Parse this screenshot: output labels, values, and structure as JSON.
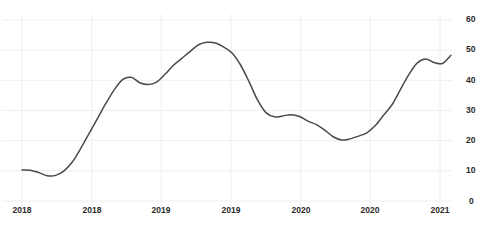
{
  "chart_data": {
    "type": "line",
    "title": "",
    "xlabel": "",
    "ylabel": "",
    "ylim": [
      0,
      60
    ],
    "yticks": [
      0,
      10,
      20,
      30,
      40,
      50,
      60
    ],
    "ytick_labels": [
      "0",
      "10",
      "20",
      "30",
      "40",
      "50",
      "60"
    ],
    "xtick_labels": [
      "2018",
      "2018",
      "2019",
      "2019",
      "2020",
      "2020",
      "2021"
    ],
    "grid": true,
    "legend": null,
    "series": [
      {
        "name": "series-1",
        "color": "#4a4a4a",
        "x": [
          0,
          1,
          2,
          3,
          4,
          5,
          6,
          7,
          8,
          9,
          10,
          11,
          12,
          13,
          14,
          15,
          16,
          17,
          18,
          19,
          20,
          21,
          22,
          23,
          24,
          25,
          26,
          27,
          28,
          29,
          30,
          31,
          32,
          33,
          34,
          35,
          36,
          37,
          38
        ],
        "values": [
          10.3,
          10.2,
          9.4,
          8.4,
          8.5,
          10.0,
          13.0,
          17.5,
          22.5,
          27.5,
          32.5,
          37.0,
          40.3,
          41.0,
          39.2,
          38.6,
          39.4,
          42.0,
          45.0,
          47.3,
          49.6,
          51.8,
          52.6,
          52.4,
          51.0,
          49.0,
          45.0,
          39.5,
          33.5,
          29.3,
          27.9,
          28.2,
          28.6,
          28.0,
          26.5,
          25.3,
          23.5,
          21.3,
          20.2
        ]
      }
    ],
    "series_tail": {
      "x": [
        38,
        39,
        40,
        41,
        42,
        43,
        44,
        45,
        46,
        47,
        48
      ],
      "values": [
        20.2,
        20.6,
        21.5,
        22.6,
        25.0,
        28.5,
        32.0,
        37.0,
        42.0,
        45.8,
        47.1
      ]
    },
    "series_end": {
      "x": [
        48,
        49,
        50,
        51
      ],
      "values": [
        47.1,
        45.9,
        45.6,
        48.3
      ]
    },
    "axis_color": "#eeeeee",
    "line_color": "#4a4a4a",
    "background": "#ffffff"
  },
  "axis": {
    "y_labels": [
      "60",
      "50",
      "40",
      "30",
      "20",
      "10",
      "0"
    ],
    "x_labels": [
      "2018",
      "2018",
      "2019",
      "2019",
      "2020",
      "2020",
      "2021"
    ]
  },
  "header": {
    "title_fragment": ""
  }
}
